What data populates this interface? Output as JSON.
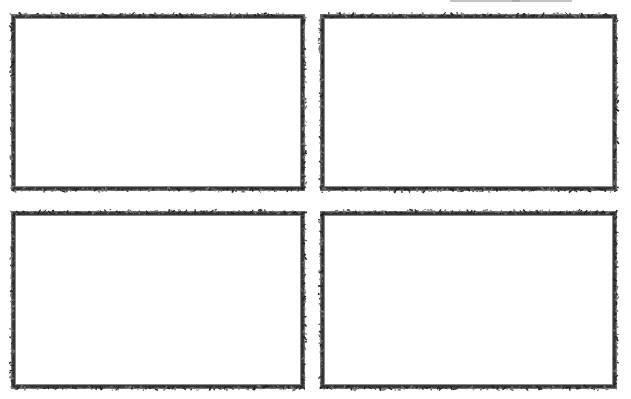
{
  "sheet": {
    "layout": "2x2 grid of blank decorative frames",
    "border_style": "sketchy hand-drawn",
    "border_color": "#3a3a3a",
    "background": "#ffffff",
    "frames": [
      {
        "id": "top-left",
        "x": 12,
        "y": 15,
        "w": 292,
        "h": 175
      },
      {
        "id": "top-right",
        "x": 321,
        "y": 15,
        "w": 295,
        "h": 175
      },
      {
        "id": "bottom-left",
        "x": 12,
        "y": 212,
        "w": 292,
        "h": 176
      },
      {
        "id": "bottom-right",
        "x": 321,
        "y": 212,
        "w": 295,
        "h": 176
      }
    ]
  }
}
